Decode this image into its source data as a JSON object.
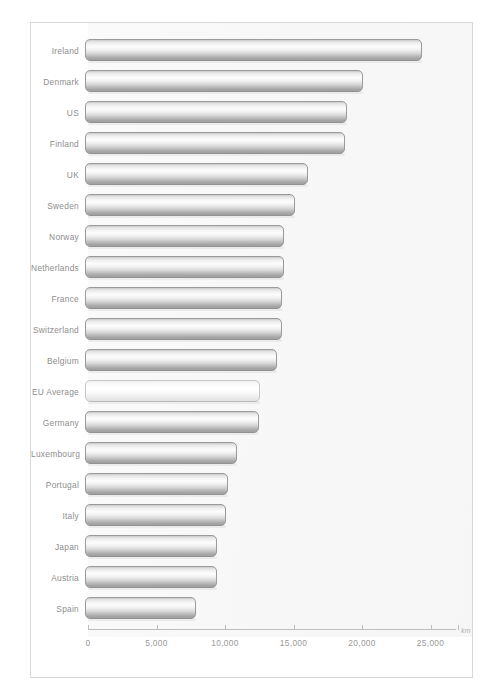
{
  "chart_data": {
    "type": "bar",
    "orientation": "horizontal",
    "title": "",
    "xlabel": "km",
    "ylabel": "",
    "unit": "km",
    "xlim": [
      0,
      27000
    ],
    "axis_max_tick": 25000,
    "grid": false,
    "legend": "none",
    "tick_values": [
      0,
      5000,
      10000,
      15000,
      20000,
      25000
    ],
    "tick_labels": [
      "0",
      "5,000",
      "10,000",
      "15,000",
      "20,000",
      "25,000"
    ],
    "categories": [
      "Ireland",
      "Denmark",
      "US",
      "Finland",
      "UK",
      "Sweden",
      "Norway",
      "Netherlands",
      "France",
      "Switzerland",
      "Belgium",
      "EU Average",
      "Germany",
      "Luxembourg",
      "Portugal",
      "Italy",
      "Japan",
      "Austria",
      "Spain"
    ],
    "values": [
      24600,
      20300,
      19100,
      19000,
      16300,
      15300,
      14500,
      14500,
      14400,
      14400,
      14000,
      12800,
      12700,
      11100,
      10400,
      10300,
      9600,
      9600,
      8100
    ],
    "highlight_category": "EU Average",
    "bars": [
      {
        "label": "Ireland",
        "value": 24600,
        "highlight": false
      },
      {
        "label": "Denmark",
        "value": 20300,
        "highlight": false
      },
      {
        "label": "US",
        "value": 19100,
        "highlight": false
      },
      {
        "label": "Finland",
        "value": 19000,
        "highlight": false
      },
      {
        "label": "UK",
        "value": 16300,
        "highlight": false
      },
      {
        "label": "Sweden",
        "value": 15300,
        "highlight": false
      },
      {
        "label": "Norway",
        "value": 14500,
        "highlight": false
      },
      {
        "label": "Netherlands",
        "value": 14500,
        "highlight": false
      },
      {
        "label": "France",
        "value": 14400,
        "highlight": false
      },
      {
        "label": "Switzerland",
        "value": 14400,
        "highlight": false
      },
      {
        "label": "Belgium",
        "value": 14000,
        "highlight": false
      },
      {
        "label": "EU Average",
        "value": 12800,
        "highlight": true
      },
      {
        "label": "Germany",
        "value": 12700,
        "highlight": false
      },
      {
        "label": "Luxembourg",
        "value": 11100,
        "highlight": false
      },
      {
        "label": "Portugal",
        "value": 10400,
        "highlight": false
      },
      {
        "label": "Italy",
        "value": 10300,
        "highlight": false
      },
      {
        "label": "Japan",
        "value": 9600,
        "highlight": false
      },
      {
        "label": "Austria",
        "value": 9600,
        "highlight": false
      },
      {
        "label": "Spain",
        "value": 8100,
        "highlight": false
      }
    ]
  },
  "colors": {
    "bar_fill_light": "#fdfdfd",
    "bar_fill_dark": "#9d9d9d",
    "bar_border": "#9a9a9a",
    "highlight_fill": "#f8f8f8",
    "axis": "#bdbdbd",
    "label_text": "#8e8e8e",
    "frame": "#d8d8d8",
    "background": "#ffffff"
  },
  "caption": ""
}
